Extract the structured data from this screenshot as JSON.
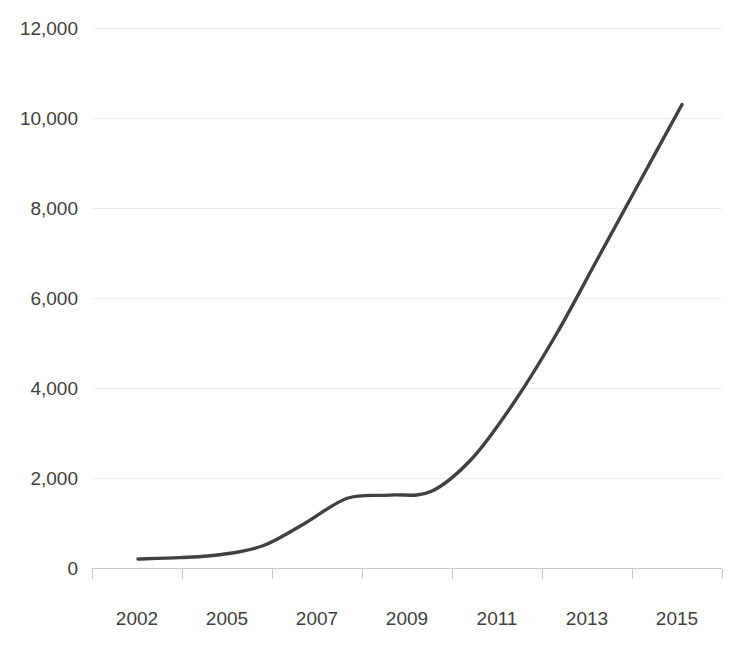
{
  "chart_data": {
    "type": "line",
    "title": "",
    "subtitle": "",
    "xlabel": "",
    "ylabel": "",
    "grid": true,
    "legend": false,
    "legend_position": "none",
    "line_color": "#404040",
    "gridline_color": "#ededed",
    "axis_color": "#c9c9c9",
    "text_color": "#404040",
    "xlim": [
      2001,
      2016
    ],
    "ylim": [
      0,
      12000
    ],
    "x": [
      2002,
      2003,
      2004,
      2005,
      2006,
      2007,
      2008,
      2009,
      2010,
      2011,
      2012,
      2013,
      2014,
      2015
    ],
    "values": [
      200,
      230,
      300,
      500,
      1000,
      1550,
      1620,
      1700,
      2450,
      3700,
      5200,
      6900,
      8600,
      10300
    ],
    "series": [
      {
        "name": "",
        "values": [
          200,
          230,
          300,
          500,
          1000,
          1550,
          1620,
          1700,
          2450,
          3700,
          5200,
          6900,
          8600,
          10300
        ]
      }
    ],
    "ytick_values": [
      0,
      2000,
      4000,
      6000,
      8000,
      10000,
      12000
    ],
    "ytick_labels": [
      "0",
      "2,000",
      "4,000",
      "6,000",
      "8,000",
      "10,000",
      "12,000"
    ],
    "xtick_labels": [
      "2002",
      "2005",
      "2007",
      "2009",
      "2011",
      "2013",
      "2015"
    ],
    "annotations": []
  }
}
